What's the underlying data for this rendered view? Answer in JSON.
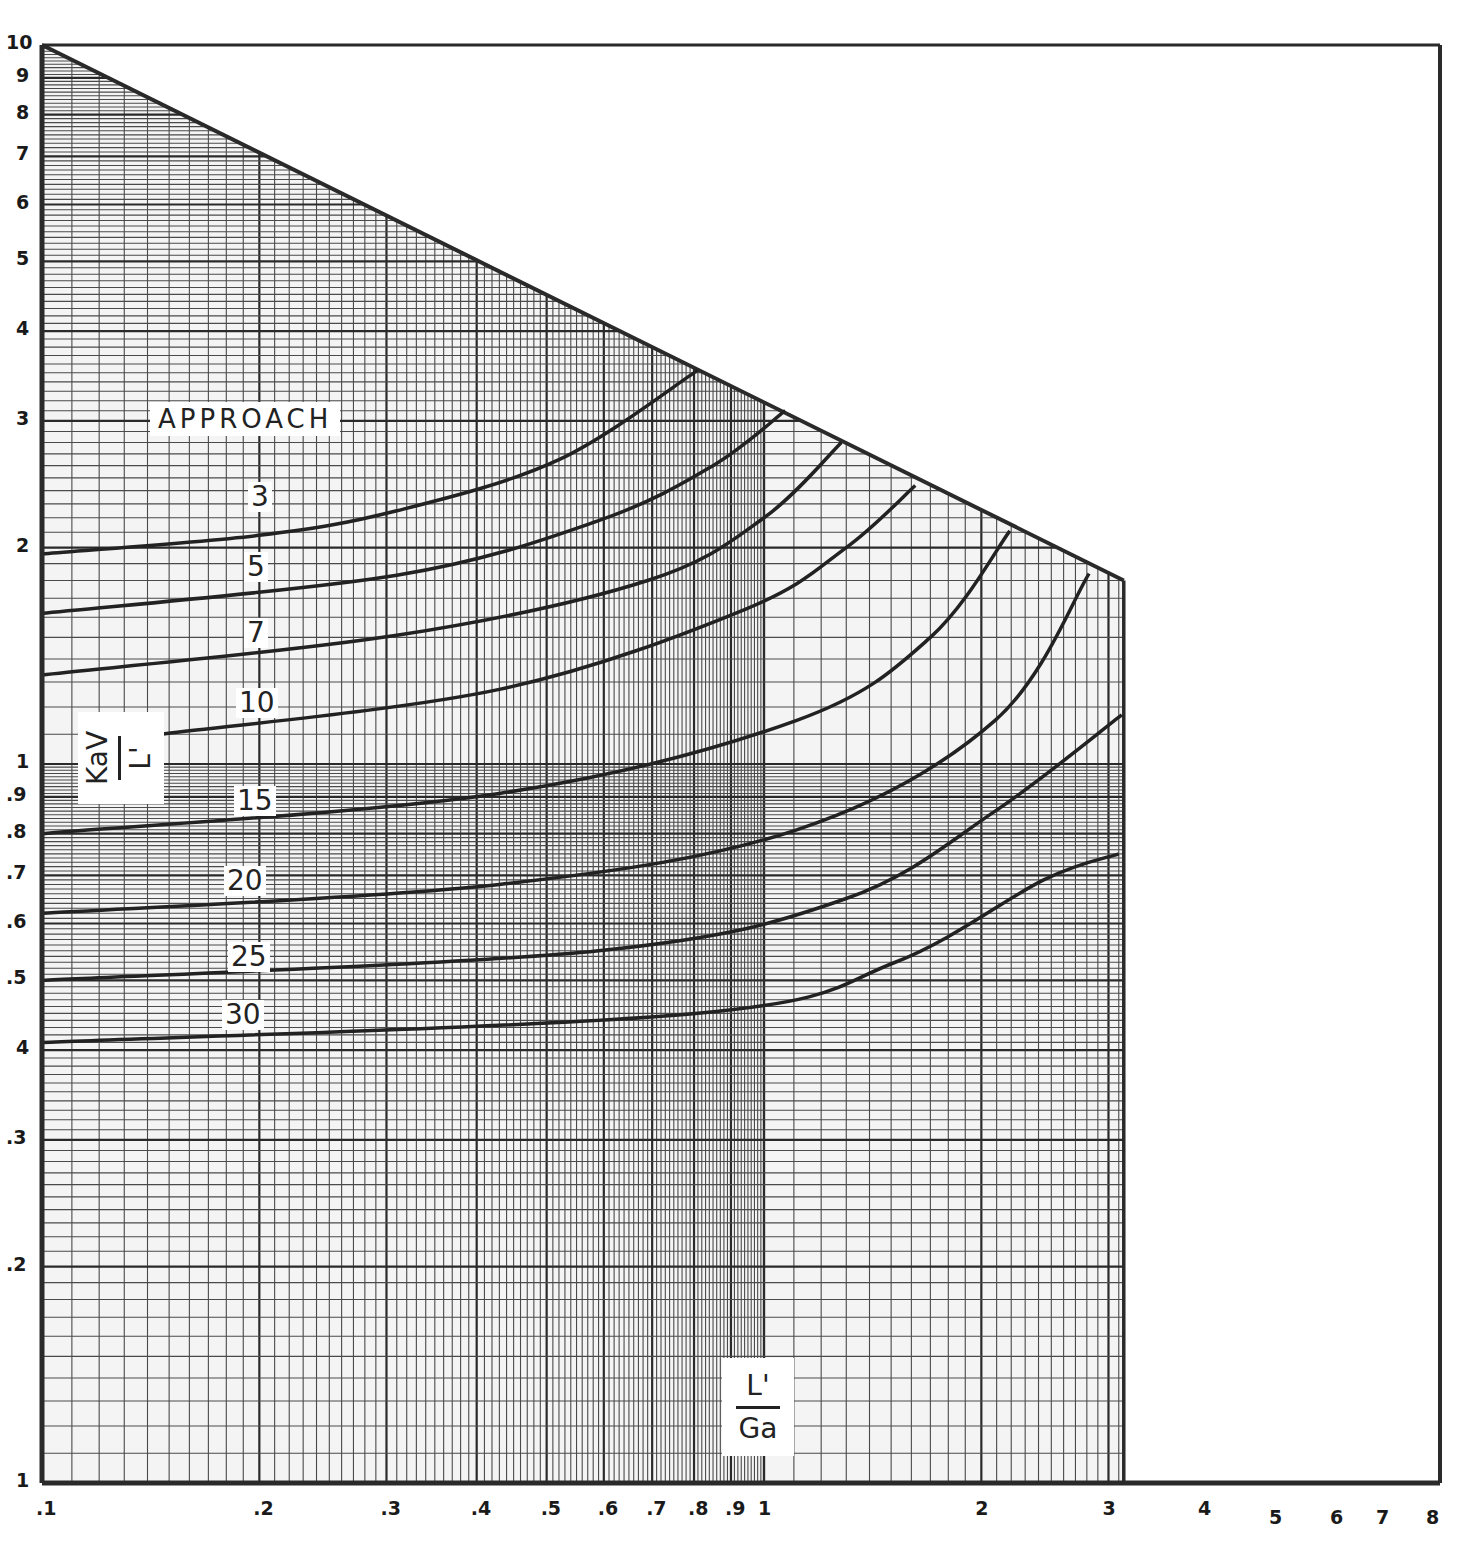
{
  "chart_data": {
    "type": "line",
    "scale": {
      "x": "log",
      "y": "log"
    },
    "title": "",
    "xlabel": "L'/Ga",
    "ylabel": "KaV/L'",
    "xlim": [
      0.1,
      8
    ],
    "ylim": [
      0.1,
      10
    ],
    "grid": true,
    "x_ticks": [
      ".1",
      ".2",
      ".3",
      ".4",
      ".5",
      ".6",
      ".7",
      ".8",
      ".9",
      "1",
      "2",
      "3",
      "4",
      "5",
      "6",
      "7",
      "8"
    ],
    "y_ticks": [
      "10",
      "9",
      "8",
      "7",
      "6",
      "5",
      "4",
      "3",
      "2",
      "1",
      ".9",
      ".8",
      ".7",
      ".6",
      ".5",
      "4",
      ".3",
      ".2",
      "1"
    ],
    "legend_title": "APPROACH",
    "boundary": {
      "name": "limit line",
      "x": [
        0.1,
        3.15
      ],
      "y": [
        10,
        1.8
      ]
    },
    "series": [
      {
        "name": "3",
        "x": [
          0.1,
          0.2,
          0.31,
          0.52,
          0.81
        ],
        "y": [
          1.96,
          2.08,
          2.25,
          2.65,
          3.53
        ]
      },
      {
        "name": "5",
        "x": [
          0.1,
          0.31,
          0.59,
          0.85,
          1.07
        ],
        "y": [
          1.62,
          1.83,
          2.18,
          2.6,
          3.1
        ]
      },
      {
        "name": "7",
        "x": [
          0.1,
          0.31,
          0.69,
          1.0,
          1.28
        ],
        "y": [
          1.33,
          1.51,
          1.8,
          2.2,
          2.8
        ]
      },
      {
        "name": "10",
        "x": [
          0.146,
          0.43,
          0.94,
          1.3,
          1.62
        ],
        "y": [
          1.1,
          1.27,
          1.64,
          2.0,
          2.44
        ]
      },
      {
        "name": "15",
        "x": [
          0.1,
          0.43,
          1.11,
          1.7,
          2.19
        ],
        "y": [
          0.8,
          0.91,
          1.15,
          1.5,
          2.11
        ]
      },
      {
        "name": "20",
        "x": [
          0.1,
          0.43,
          1.11,
          2.09,
          2.82
        ],
        "y": [
          0.62,
          0.68,
          0.81,
          1.15,
          1.84
        ]
      },
      {
        "name": "25",
        "x": [
          0.1,
          0.59,
          1.3,
          2.09,
          3.13
        ],
        "y": [
          0.5,
          0.55,
          0.65,
          0.86,
          1.17
        ]
      },
      {
        "name": "30",
        "x": [
          0.1,
          0.81,
          1.52,
          2.44,
          3.1
        ],
        "y": [
          0.41,
          0.45,
          0.53,
          0.69,
          0.75
        ]
      }
    ]
  },
  "labels": {
    "approach": "APPROACH",
    "ylabel_num": "KaV",
    "ylabel_den": "L'",
    "xlabel_num": "L'",
    "xlabel_den": "Ga",
    "curves": [
      "3",
      "5",
      "7",
      "10",
      "15",
      "20",
      "25",
      "30"
    ]
  }
}
